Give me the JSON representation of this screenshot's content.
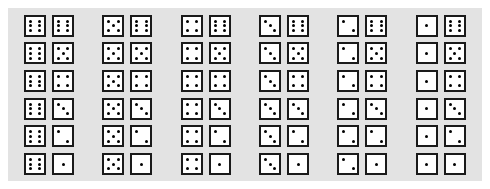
{
  "figure": {
    "type": "dice-outcome-matrix",
    "rows": 6,
    "columns": 6,
    "background_color": "#e3e3e3",
    "page_color": "#ffffff",
    "die_face_color": "#ffffff",
    "die_border_color": "#1a1a1a",
    "pip_color": "#000000"
  },
  "pip_layouts": {
    "1": [
      5
    ],
    "2": [
      1,
      9
    ],
    "3": [
      1,
      5,
      9
    ],
    "4": [
      1,
      3,
      7,
      9
    ],
    "5": [
      1,
      3,
      5,
      7,
      9
    ],
    "6": [
      1,
      3,
      4,
      6,
      7,
      9
    ]
  },
  "chart_data": {
    "type": "table",
    "title": "",
    "column_values": [
      6,
      5,
      4,
      3,
      2,
      1
    ],
    "row_values": [
      6,
      5,
      4,
      3,
      2,
      1
    ],
    "cells": [
      [
        [
          6,
          6
        ],
        [
          5,
          6
        ],
        [
          4,
          6
        ],
        [
          3,
          6
        ],
        [
          2,
          6
        ],
        [
          1,
          6
        ]
      ],
      [
        [
          6,
          5
        ],
        [
          5,
          5
        ],
        [
          4,
          5
        ],
        [
          3,
          5
        ],
        [
          2,
          5
        ],
        [
          1,
          5
        ]
      ],
      [
        [
          6,
          4
        ],
        [
          5,
          4
        ],
        [
          4,
          4
        ],
        [
          3,
          4
        ],
        [
          2,
          4
        ],
        [
          1,
          4
        ]
      ],
      [
        [
          6,
          3
        ],
        [
          5,
          3
        ],
        [
          4,
          3
        ],
        [
          3,
          3
        ],
        [
          2,
          3
        ],
        [
          1,
          3
        ]
      ],
      [
        [
          6,
          2
        ],
        [
          5,
          2
        ],
        [
          4,
          2
        ],
        [
          3,
          2
        ],
        [
          2,
          2
        ],
        [
          1,
          2
        ]
      ],
      [
        [
          6,
          1
        ],
        [
          5,
          1
        ],
        [
          4,
          1
        ],
        [
          3,
          1
        ],
        [
          2,
          1
        ],
        [
          1,
          1
        ]
      ]
    ]
  }
}
